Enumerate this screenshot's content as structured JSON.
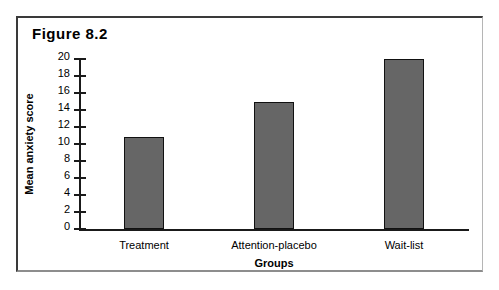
{
  "figure": {
    "caption": "Figure 8.2"
  },
  "chart_data": {
    "type": "bar",
    "title": "Figure 8.2",
    "categories": [
      "Treatment",
      "Attention-placebo",
      "Wait-list"
    ],
    "values": [
      10.8,
      15.0,
      20.0
    ],
    "xlabel": "Groups",
    "ylabel": "Mean anxiety score",
    "ylim": [
      0,
      20
    ],
    "ytick_step": 2,
    "yticks": [
      0,
      2,
      4,
      6,
      8,
      10,
      12,
      14,
      16,
      18,
      20
    ],
    "ytick_labels": [
      "0",
      "2",
      "4",
      "6",
      "8",
      "10",
      "12",
      "14",
      "16",
      "18",
      "20"
    ],
    "grid": false,
    "legend": null,
    "bar_color": "#666666",
    "bar_edge_color": "#111111",
    "axis_color": "#1a1a1a"
  }
}
